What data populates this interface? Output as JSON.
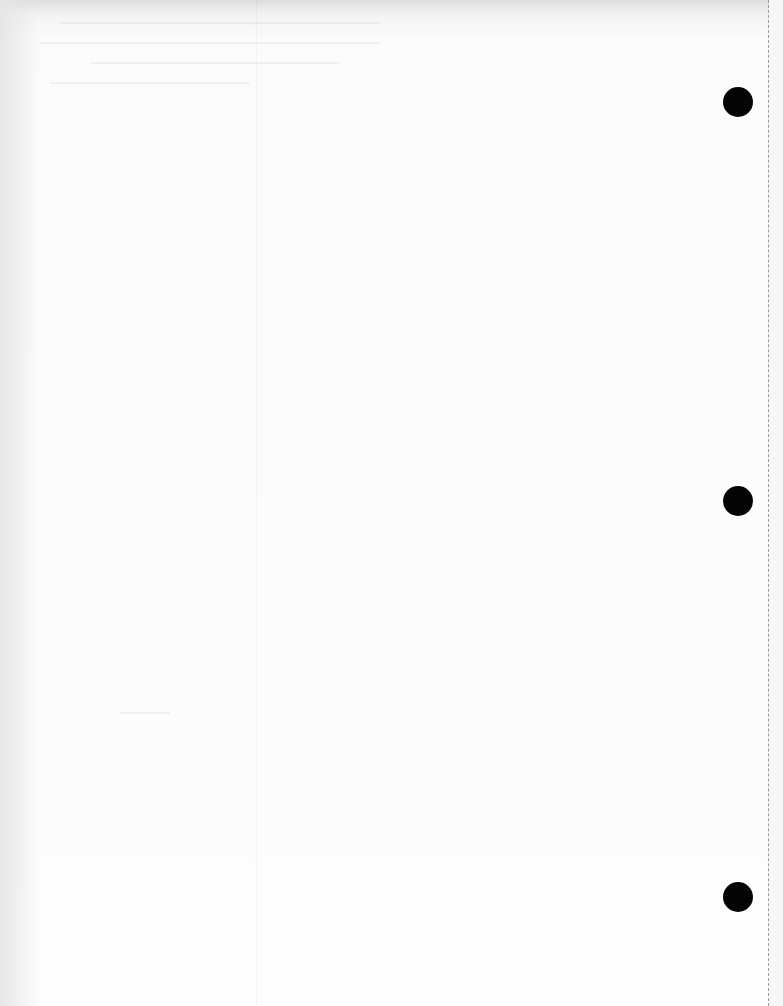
{
  "page": {
    "type": "blank hole-punched sheet",
    "background_color": "#fdfdfd",
    "hole_color": "#050505",
    "perforation_color": "#9a9a9a"
  },
  "punch_holes": [
    {
      "cx": 738,
      "cy": 102
    },
    {
      "cx": 738,
      "cy": 501
    },
    {
      "cx": 738,
      "cy": 897
    }
  ]
}
